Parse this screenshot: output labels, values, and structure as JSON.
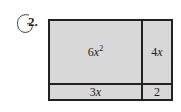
{
  "problem": {
    "number": "2."
  },
  "area_model": {
    "cells": {
      "top_left": {
        "coefficient": "6",
        "variable": "x",
        "exponent": "2"
      },
      "top_right": {
        "coefficient": "4",
        "variable": "x"
      },
      "bottom_left": {
        "coefficient": "3",
        "variable": "x"
      },
      "bottom_right": {
        "value": "2"
      }
    },
    "fill_color": "#d8d8d8",
    "border_color": "#222222"
  }
}
